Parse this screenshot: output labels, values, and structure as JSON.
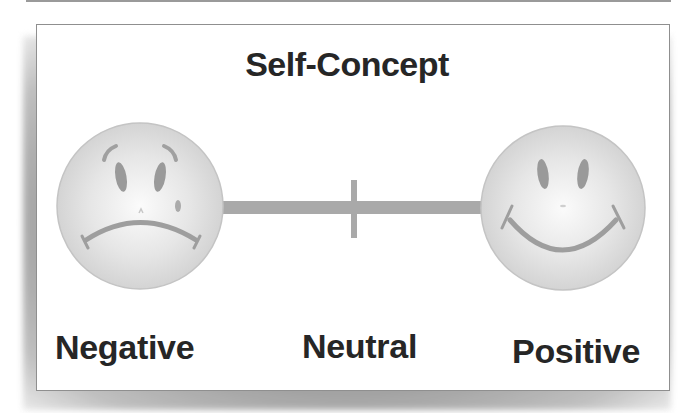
{
  "diagram": {
    "title": "Self-Concept",
    "scale": {
      "type": "continuum",
      "left_pole": {
        "label": "Negative",
        "icon": "sad-face-icon"
      },
      "midpoint": {
        "label": "Neutral",
        "marker": "tick-mark"
      },
      "right_pole": {
        "label": "Positive",
        "icon": "happy-face-icon"
      }
    },
    "colors": {
      "face_fill": "#dedede",
      "feature": "#9a9a9a",
      "bar": "#aaaaaa",
      "text": "#262626",
      "border": "#8f8f8f"
    }
  }
}
